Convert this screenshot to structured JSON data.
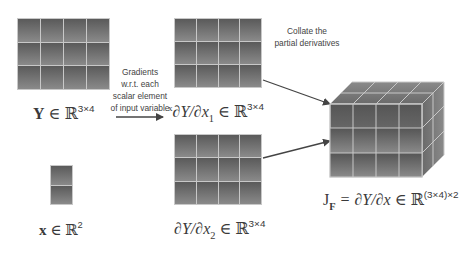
{
  "matrices": {
    "Y": {
      "rows": 3,
      "cols": 4,
      "label_var": "Y",
      "label_in": "∈",
      "label_set": "ℝ",
      "label_dims": "3×4"
    },
    "x": {
      "rows": 2,
      "cols": 1,
      "label_var": "x",
      "label_in": "∈",
      "label_set": "ℝ",
      "label_dims": "2"
    },
    "dY_dx1": {
      "rows": 3,
      "cols": 4,
      "label_prefix": "x",
      "label_expr": "∂Y/∂x",
      "label_sub": "1",
      "label_in": "∈",
      "label_set": "ℝ",
      "label_dims": "3×4"
    },
    "dY_dx2": {
      "rows": 3,
      "cols": 4,
      "label_expr": "∂Y/∂x",
      "label_sub": "2",
      "label_in": "∈",
      "label_set": "ℝ",
      "label_dims": "3×4"
    },
    "jacobian": {
      "depth": 2,
      "rows": 3,
      "cols": 4,
      "label_J": "J",
      "label_J_sub": "F",
      "label_expr": "= ∂Y/∂x",
      "label_in": "∈",
      "label_set": "ℝ",
      "label_dims": "(3×4)×2"
    }
  },
  "annotations": {
    "gradients": [
      "Gradients",
      "w.r.t. each",
      "scalar element",
      "of input variable"
    ],
    "collate": [
      "Collate the",
      "partial derivatives"
    ]
  },
  "colors": {
    "cell_dark": "#5a5a5a",
    "cell_light": "#8a8a8a",
    "grid_line": "#c8c8c8",
    "arrow": "#444444",
    "text": "#3a3a3a"
  }
}
